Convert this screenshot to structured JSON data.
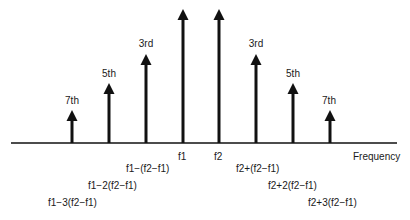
{
  "diagram": {
    "type": "frequency-spectrum-intermodulation",
    "axis_label": "Frequency",
    "colors": {
      "line": "#111111",
      "text": "#1a1a1a",
      "background": "#ffffff"
    },
    "arrows": [
      {
        "id": "f1-3d",
        "x": 72,
        "top": 110,
        "order_label": "7th",
        "freq_label": "f1−3(f2−f1)"
      },
      {
        "id": "f1-2d",
        "x": 109,
        "top": 83,
        "order_label": "5th",
        "freq_label": "f1−2(f2−f1)"
      },
      {
        "id": "f1-1d",
        "x": 146,
        "top": 54,
        "order_label": "3rd",
        "freq_label": "f1−(f2−f1)"
      },
      {
        "id": "f1",
        "x": 183,
        "top": 9,
        "order_label": "",
        "freq_label": "f1"
      },
      {
        "id": "f2",
        "x": 219,
        "top": 9,
        "order_label": "",
        "freq_label": "f2"
      },
      {
        "id": "f2+1d",
        "x": 256,
        "top": 54,
        "order_label": "3rd",
        "freq_label": "f2+(f2−f1)"
      },
      {
        "id": "f2+2d",
        "x": 293,
        "top": 83,
        "order_label": "5th",
        "freq_label": "f2+2(f2−f1)"
      },
      {
        "id": "f2+3d",
        "x": 330,
        "top": 110,
        "order_label": "7th",
        "freq_label": "f2+3(f2−f1)"
      }
    ],
    "order_labels": {
      "left_7th": "7th",
      "left_5th": "5th",
      "left_3rd": "3rd",
      "right_3rd": "3rd",
      "right_5th": "5th",
      "right_7th": "7th"
    },
    "freq_labels": {
      "f1": "f1",
      "f2": "f2",
      "f1_minus_1": "f1−(f2−f1)",
      "f1_minus_2": "f1−2(f2−f1)",
      "f1_minus_3": "f1−3(f2−f1)",
      "f2_plus_1": "f2+(f2−f1)",
      "f2_plus_2": "f2+2(f2−f1)",
      "f2_plus_3": "f2+3(f2−f1)"
    }
  }
}
